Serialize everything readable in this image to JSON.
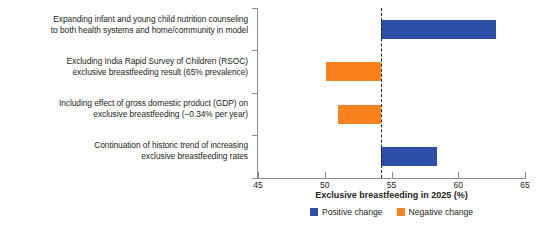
{
  "chart_data": {
    "type": "bar",
    "orientation": "horizontal",
    "title": "",
    "xlabel": "Exclusive breastfeeding in 2025 (%)",
    "ylabel": "",
    "xlim": [
      45,
      65
    ],
    "xticks": [
      45,
      50,
      55,
      60,
      65
    ],
    "xticklabels": [
      "45",
      "50",
      "55",
      "60",
      "65"
    ],
    "grid": false,
    "baseline": 54.2,
    "baseline_style": "dashed",
    "legend_position": "bottom",
    "categories": [
      "Expanding infant and young child nutrition counseling to both health systems and home/community in model",
      "Excluding India Rapid Survey of Children (RSOC) exclusive breastfeeding result (65% prevalence)",
      "Including effect of gross domestic product (GDP) on exclusive breastfeeding (−0.34% per year)",
      "Continuation of historic trend of increasing exclusive breastfeeding rates"
    ],
    "category_lines": [
      [
        "Expanding infant and young child nutrition counseling",
        "to both health systems and home/community in model"
      ],
      [
        "Excluding India Rapid Survey of Children (RSOC)",
        "exclusive breastfeeding result (65% prevalence)"
      ],
      [
        "Including effect of gross domestic product (GDP) on",
        "exclusive breastfeeding (−0.34% per year)"
      ],
      [
        "Continuation of historic trend of increasing",
        "exclusive breastfeeding rates"
      ]
    ],
    "bars": [
      {
        "category_index": 0,
        "start": 54.2,
        "end": 62.8,
        "change": 8.6,
        "direction": "positive",
        "color": "#2e4fa8"
      },
      {
        "category_index": 1,
        "start": 50.1,
        "end": 54.2,
        "change": -4.1,
        "direction": "negative",
        "color": "#f7821e"
      },
      {
        "category_index": 2,
        "start": 51.0,
        "end": 54.2,
        "change": -3.2,
        "direction": "negative",
        "color": "#f7821e"
      },
      {
        "category_index": 3,
        "start": 54.2,
        "end": 58.4,
        "change": 4.2,
        "direction": "positive",
        "color": "#2e4fa8"
      }
    ],
    "legend": [
      {
        "label": "Positive change",
        "color": "#2e4fa8"
      },
      {
        "label": "Negative change",
        "color": "#f7821e"
      }
    ]
  },
  "colors": {
    "positive": "#2e4fa8",
    "negative": "#f7821e",
    "axis": "#8c8c8c",
    "text": "#231f20",
    "background": "#ffffff"
  }
}
